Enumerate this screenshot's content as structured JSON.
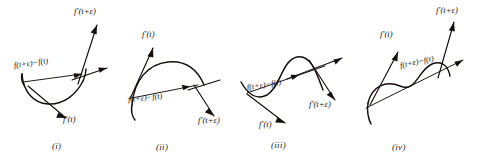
{
  "figure": {
    "background_color": "#ffffff",
    "ink_color": "#140f0c",
    "panels": [
      {
        "caption": "(i)",
        "curve_shape": "convex-u",
        "labels": {
          "tangent_start": "f'(t)",
          "tangent_end": "f'(t+ε)",
          "chord": "f(t+ε)−f(t)"
        },
        "label_positions": {
          "tangent_end": "top-right",
          "chord": "upper-left-along-chord",
          "tangent_start": "bottom-center"
        }
      },
      {
        "caption": "(ii)",
        "curve_shape": "concave-arch",
        "labels": {
          "tangent_start": "f'(t)",
          "tangent_end": "f'(t+ε)",
          "chord": "f(t+ε)−f(t)"
        },
        "label_positions": {
          "tangent_start": "top-left",
          "chord": "below-chord",
          "tangent_end": "bottom-right"
        }
      },
      {
        "caption": "(iii)",
        "curve_shape": "s-curve-rise-fall",
        "labels": {
          "tangent_start": "f'(t)",
          "tangent_end": "f'(t+ε)",
          "chord": "f(t+ε)−f(t)"
        },
        "label_positions": {
          "chord": "center-along-chord",
          "tangent_start": "bottom-left",
          "tangent_end": "right"
        }
      },
      {
        "caption": "(iv)",
        "curve_shape": "s-curve-fall-rise",
        "labels": {
          "tangent_start": "f'(t)",
          "tangent_end": "f'(t+ε)",
          "chord": "f(t+ε)−f(t)"
        },
        "label_positions": {
          "tangent_start": "upper-left",
          "tangent_end": "top-right",
          "chord": "center-along-chord"
        }
      }
    ]
  }
}
